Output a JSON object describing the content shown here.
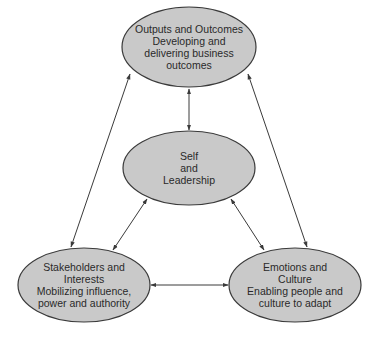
{
  "colors": {
    "node_fill": "#c9c9c9",
    "node_stroke": "#3a3a3a",
    "arrow": "#3a3a3a",
    "background": "#ffffff",
    "text": "#2a2a2a"
  },
  "nodes": {
    "outputs": {
      "lines": [
        "Outputs and Outcomes",
        "Developing and",
        "delivering business",
        "outcomes"
      ],
      "cx": 189,
      "cy": 47,
      "rx": 67,
      "ry": 40
    },
    "self": {
      "lines": [
        "Self",
        "and",
        "Leadership"
      ],
      "cx": 189,
      "cy": 168,
      "rx": 66,
      "ry": 37
    },
    "stakeholders": {
      "lines": [
        "Stakeholders and",
        "Interests",
        "Mobilizing influence,",
        "power and authority"
      ],
      "cx": 84,
      "cy": 285,
      "rx": 66,
      "ry": 37
    },
    "emotions": {
      "lines": [
        "Emotions and",
        "Culture",
        "Enabling people and",
        "culture to adapt"
      ],
      "cx": 295,
      "cy": 285,
      "rx": 66,
      "ry": 37
    }
  },
  "edges": [
    {
      "from": "outputs",
      "to": "self",
      "x1": 189,
      "y1": 89,
      "x2": 189,
      "y2": 130,
      "bidirectional": true
    },
    {
      "from": "outputs",
      "to": "stakeholders",
      "x1": 130,
      "y1": 74,
      "x2": 71,
      "y2": 247,
      "bidirectional": true
    },
    {
      "from": "outputs",
      "to": "emotions",
      "x1": 248,
      "y1": 74,
      "x2": 307,
      "y2": 247,
      "bidirectional": true
    },
    {
      "from": "self",
      "to": "stakeholders",
      "x1": 147,
      "y1": 199,
      "x2": 113,
      "y2": 250,
      "bidirectional": true
    },
    {
      "from": "self",
      "to": "emotions",
      "x1": 231,
      "y1": 199,
      "x2": 264,
      "y2": 250,
      "bidirectional": true
    },
    {
      "from": "stakeholders",
      "to": "emotions",
      "x1": 151,
      "y1": 285,
      "x2": 228,
      "y2": 285,
      "bidirectional": true
    }
  ]
}
